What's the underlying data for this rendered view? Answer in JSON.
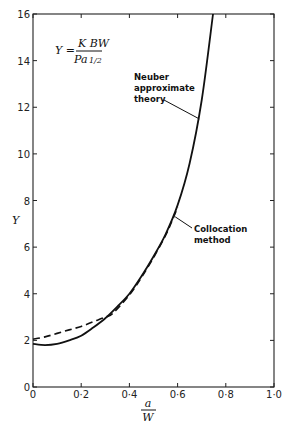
{
  "chart_data": {
    "type": "line",
    "title": "",
    "formula": {
      "lhs": "Y =",
      "numerator": "K BW",
      "denominator": "Pa",
      "denominator_exponent": "1/2"
    },
    "xlabel": {
      "numerator": "a",
      "denominator": "W"
    },
    "ylabel": "Y",
    "xlim": [
      0,
      1.0
    ],
    "ylim": [
      0,
      16
    ],
    "grid": false,
    "x_ticks": [
      "0",
      "0·2",
      "0·4",
      "0·6",
      "0·8",
      "1·0"
    ],
    "x_tick_values": [
      0,
      0.2,
      0.4,
      0.6,
      0.8,
      1.0
    ],
    "y_ticks": [
      "0",
      "2",
      "4",
      "6",
      "8",
      "10",
      "12",
      "14",
      "16"
    ],
    "y_tick_values": [
      0,
      2,
      4,
      6,
      8,
      10,
      12,
      14,
      16
    ],
    "series": [
      {
        "name": "Neuber approximate theory",
        "style": "solid",
        "x": [
          0,
          0.05,
          0.1,
          0.15,
          0.2,
          0.25,
          0.3,
          0.35,
          0.4,
          0.45,
          0.5,
          0.55,
          0.6,
          0.65,
          0.7,
          0.747
        ],
        "y": [
          1.85,
          1.8,
          1.85,
          2.0,
          2.2,
          2.55,
          2.95,
          3.45,
          4.0,
          4.75,
          5.6,
          6.55,
          7.8,
          9.6,
          12.3,
          16.0
        ]
      },
      {
        "name": "Collocation method",
        "style": "dashed",
        "x": [
          0,
          0.05,
          0.1,
          0.15,
          0.2,
          0.25,
          0.3,
          0.33,
          0.4,
          0.45,
          0.5,
          0.55,
          0.58,
          0.6
        ],
        "y": [
          2.05,
          2.15,
          2.3,
          2.45,
          2.6,
          2.8,
          3.0,
          3.15,
          3.95,
          4.7,
          5.55,
          6.5,
          7.2,
          7.7
        ]
      }
    ],
    "annotations": [
      {
        "text": [
          "Neuber",
          "approximate",
          "theory"
        ],
        "points_to": [
          0.69,
          11.5
        ]
      },
      {
        "text": [
          "Collocation",
          "method"
        ],
        "points_to": [
          0.59,
          7.3
        ]
      }
    ]
  }
}
